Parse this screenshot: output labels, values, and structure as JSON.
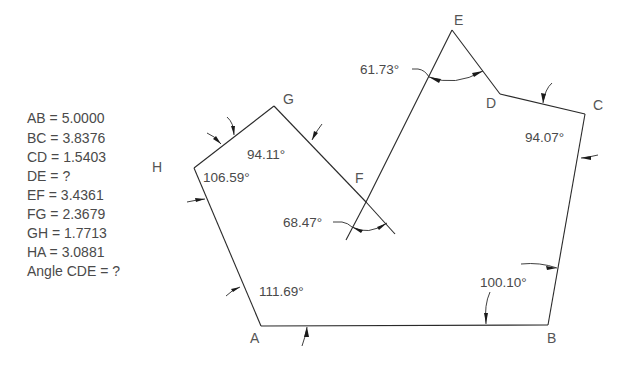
{
  "given": {
    "lines": [
      "AB = 5.0000",
      "BC = 3.8376",
      "CD = 1.5403",
      "DE = ?",
      "EF = 3.4361",
      "FG = 2.3679",
      "GH = 1.7713",
      "HA = 3.0881",
      "Angle CDE = ?"
    ]
  },
  "vertices": {
    "A": "A",
    "B": "B",
    "C": "C",
    "D": "D",
    "E": "E",
    "F": "F",
    "G": "G",
    "H": "H"
  },
  "angles": {
    "E": "61.73°",
    "C": "94.07°",
    "G": "94.11°",
    "H": "106.59°",
    "F": "68.47°",
    "A": "111.69°",
    "B": "100.10°"
  },
  "colors": {
    "line": "#2a2a2a",
    "text": "#4a4a4a",
    "background": "#ffffff"
  }
}
